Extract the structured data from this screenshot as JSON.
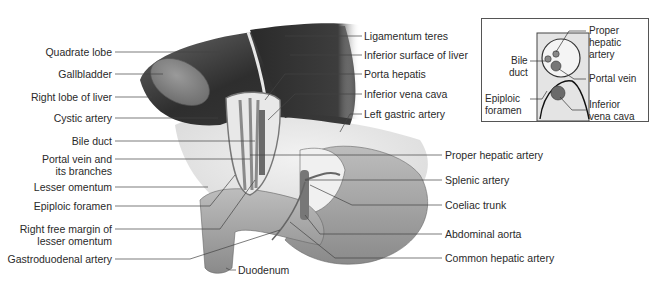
{
  "figure": {
    "left_labels": [
      {
        "id": "quadrate-lobe",
        "text": "Quadrate lobe"
      },
      {
        "id": "gallbladder",
        "text": "Gallbladder"
      },
      {
        "id": "right-lobe-of-liver",
        "text": "Right lobe of liver"
      },
      {
        "id": "cystic-artery",
        "text": "Cystic artery"
      },
      {
        "id": "bile-duct",
        "text": "Bile duct"
      },
      {
        "id": "portal-vein",
        "text": "Portal vein and",
        "text2": "its branches"
      },
      {
        "id": "lesser-omentum",
        "text": "Lesser omentum"
      },
      {
        "id": "epiploic-foramen",
        "text": "Epiploic foramen"
      },
      {
        "id": "right-free-margin",
        "text": "Right free margin of",
        "text2": "lesser omentum"
      },
      {
        "id": "gastroduodenal-artery",
        "text": "Gastroduodenal artery"
      }
    ],
    "right_labels": [
      {
        "id": "ligamentum-teres",
        "text": "Ligamentum teres"
      },
      {
        "id": "inferior-surface-of-liver",
        "text": "Inferior surface of liver"
      },
      {
        "id": "porta-hepatis",
        "text": "Porta hepatis"
      },
      {
        "id": "inferior-vena-cava",
        "text": "Inferior vena cava"
      },
      {
        "id": "left-gastric-artery",
        "text": "Left gastric artery"
      },
      {
        "id": "proper-hepatic-artery",
        "text": "Proper hepatic artery"
      },
      {
        "id": "splenic-artery",
        "text": "Splenic artery"
      },
      {
        "id": "coeliac-trunk",
        "text": "Coeliac trunk"
      },
      {
        "id": "abdominal-aorta",
        "text": "Abdominal aorta"
      },
      {
        "id": "common-hepatic-artery",
        "text": "Common hepatic artery"
      }
    ],
    "bottom_labels": [
      {
        "id": "duodenum",
        "text": "Duodenum"
      }
    ],
    "inset": {
      "labels": {
        "proper_hepatic_1": "Proper",
        "proper_hepatic_2": "hepatic",
        "proper_hepatic_3": "artery",
        "bile_duct_1": "Bile",
        "bile_duct_2": "duct",
        "portal_vein": "Portal vein",
        "epiploic_1": "Epiploic",
        "epiploic_2": "foramen",
        "ivc_1": "Inferior",
        "ivc_2": "vena cava"
      }
    }
  }
}
